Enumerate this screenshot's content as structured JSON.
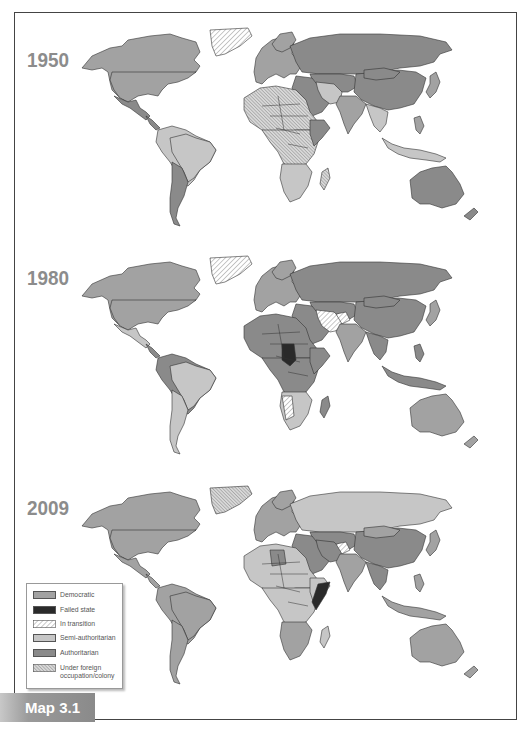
{
  "figure": {
    "label": "Map 3.1"
  },
  "colors": {
    "democratic": "#a2a2a2",
    "failed_state": "#2a2a2a",
    "in_transition": "hatch-light",
    "semi_authoritarian": "#c6c6c6",
    "authoritarian": "#8a8a8a",
    "foreign_occupation": "hatch-dense",
    "border": "#333333",
    "year_text": "#8c8c8c"
  },
  "panels": [
    {
      "year": "1950"
    },
    {
      "year": "1980"
    },
    {
      "year": "2009"
    }
  ],
  "legend": {
    "items": [
      {
        "key": "democratic",
        "label": "Democratic"
      },
      {
        "key": "failed_state",
        "label": "Failed state"
      },
      {
        "key": "in_transition",
        "label": "In transition"
      },
      {
        "key": "semi_authoritarian",
        "label": "Semi-authoritarian"
      },
      {
        "key": "authoritarian",
        "label": "Authoritarian"
      },
      {
        "key": "foreign_occupation",
        "label_line1": "Under foreign",
        "label_line2": "occupation/colony"
      }
    ]
  }
}
